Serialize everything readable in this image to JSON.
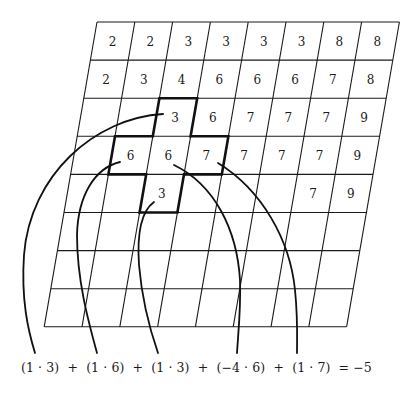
{
  "diagram": {
    "title": "",
    "grid": {
      "rows": 8,
      "cols": 8,
      "values": [
        [
          "2",
          "2",
          "3",
          "3",
          "3",
          "3",
          "8",
          "8"
        ],
        [
          "2",
          "3",
          "4",
          "6",
          "6",
          "6",
          "7",
          "8"
        ],
        [
          "",
          "",
          "3",
          "6",
          "7",
          "7",
          "7",
          "9"
        ],
        [
          "",
          "6",
          "6",
          "7",
          "7",
          "7",
          "7",
          "9"
        ],
        [
          "",
          "",
          "3",
          "",
          "",
          "",
          "7",
          "9"
        ],
        [
          "",
          "",
          "",
          "",
          "",
          "",
          "",
          ""
        ],
        [
          "",
          "",
          "",
          "",
          "",
          "",
          "",
          ""
        ],
        [
          "",
          "",
          "",
          "",
          "",
          "",
          "",
          ""
        ]
      ]
    },
    "kernel_cells": [
      {
        "row": 2,
        "col": 2,
        "weight": "1",
        "value": "3"
      },
      {
        "row": 3,
        "col": 1,
        "weight": "1",
        "value": "6"
      },
      {
        "row": 3,
        "col": 2,
        "weight": "-4",
        "value": "6"
      },
      {
        "row": 3,
        "col": 3,
        "weight": "1",
        "value": "7"
      },
      {
        "row": 4,
        "col": 2,
        "weight": "1",
        "value": "3"
      }
    ],
    "formula": {
      "terms": [
        "(1 · 3)",
        "(1 · 6)",
        "(1 · 3)",
        "(−4 · 6)",
        "(1 · 7)"
      ],
      "operator": "+",
      "equals": "=",
      "result": "−5",
      "text": "(1 · 3)  +  (1 · 6)  +  (1 · 3)  +  (−4 · 6)  +  (1 · 7)  = −5"
    },
    "colors": {
      "line": "#1a1a1a",
      "background": "#ffffff"
    }
  }
}
